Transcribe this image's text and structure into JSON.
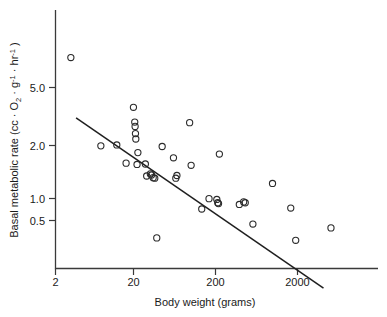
{
  "chart_data": {
    "type": "scatter",
    "title": "",
    "xlabel": "Body weight (grams)",
    "ylabel_parts": {
      "lead": "Basal metabolic rate (cc · O",
      "sub_o2": "2",
      "mid": " · g",
      "sup_g": "-1",
      "mid2": " · hr",
      "sup_hr": "-1",
      "tail": " )"
    },
    "ylabel": "Basal metabolic rate (cc · O2 · g-1 · hr-1 )",
    "xscale": "log",
    "yscale": "log",
    "xticks": [
      2,
      20,
      200,
      2000
    ],
    "xtick_labels": [
      "2",
      "20",
      "200",
      "2000"
    ],
    "yticks": [
      5.0,
      2.0,
      1.0,
      0.5
    ],
    "ytick_labels": [
      "5.0",
      "2.0",
      "1.0",
      "0.5"
    ],
    "xlim": [
      2,
      20000
    ],
    "ylim": [
      0.12,
      12
    ],
    "grid": false,
    "legend": "none",
    "marker_style": "open-circle",
    "marker_radius_px": 3.1,
    "point_color": "#2b2b2b",
    "line_color": "#1f1f1f",
    "points": [
      {
        "x": 3.1,
        "y": 8.4
      },
      {
        "x": 7.3,
        "y": 1.82
      },
      {
        "x": 11.5,
        "y": 1.85
      },
      {
        "x": 15.0,
        "y": 1.35
      },
      {
        "x": 18.5,
        "y": 3.55
      },
      {
        "x": 19.2,
        "y": 2.75
      },
      {
        "x": 19.4,
        "y": 2.55
      },
      {
        "x": 19.6,
        "y": 2.25
      },
      {
        "x": 19.8,
        "y": 2.05
      },
      {
        "x": 20.5,
        "y": 1.32
      },
      {
        "x": 21.0,
        "y": 1.62
      },
      {
        "x": 26.0,
        "y": 1.33
      },
      {
        "x": 27.0,
        "y": 1.08
      },
      {
        "x": 30.0,
        "y": 1.12
      },
      {
        "x": 31.0,
        "y": 1.1
      },
      {
        "x": 32.5,
        "y": 1.05
      },
      {
        "x": 34.0,
        "y": 1.04
      },
      {
        "x": 36.0,
        "y": 0.37
      },
      {
        "x": 42.0,
        "y": 1.8
      },
      {
        "x": 58.0,
        "y": 1.48
      },
      {
        "x": 62.0,
        "y": 1.04
      },
      {
        "x": 64.0,
        "y": 1.09
      },
      {
        "x": 92.0,
        "y": 2.72
      },
      {
        "x": 96.0,
        "y": 1.3
      },
      {
        "x": 130.0,
        "y": 0.61
      },
      {
        "x": 160.0,
        "y": 0.73
      },
      {
        "x": 200.0,
        "y": 0.72
      },
      {
        "x": 205.0,
        "y": 0.68
      },
      {
        "x": 210.0,
        "y": 0.67
      },
      {
        "x": 215.0,
        "y": 1.58
      },
      {
        "x": 380.0,
        "y": 0.66
      },
      {
        "x": 430.0,
        "y": 0.69
      },
      {
        "x": 450.0,
        "y": 0.68
      },
      {
        "x": 560.0,
        "y": 0.47
      },
      {
        "x": 980.0,
        "y": 0.95
      },
      {
        "x": 1650.0,
        "y": 0.62
      },
      {
        "x": 1900.0,
        "y": 0.355
      },
      {
        "x": 5200.0,
        "y": 0.44
      }
    ],
    "fit_line": {
      "label": "regression line",
      "x_start": 3.6,
      "y_start": 2.95,
      "x_end": 4200,
      "y_end": 0.155
    },
    "annotations": []
  }
}
